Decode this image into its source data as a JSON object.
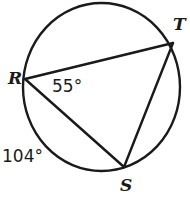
{
  "figure": {
    "kind": "circle-with-inscribed-triangle",
    "stroke_color": "#1a1a1a",
    "fill_color": "#ffffff",
    "background": "#ffffff",
    "circle": {
      "cx": 101.5,
      "cy": 87,
      "rx": 78.5,
      "ry": 84
    },
    "vertices": [
      {
        "id": "R",
        "label": "R",
        "x": 25,
        "y": 79,
        "label_x": 8,
        "label_y": 70
      },
      {
        "id": "T",
        "label": "T",
        "x": 173,
        "y": 43,
        "label_x": 173,
        "label_y": 16
      },
      {
        "id": "S",
        "label": "S",
        "x": 124,
        "y": 167,
        "label_x": 120,
        "label_y": 177
      }
    ],
    "chords": [
      {
        "name": "chord-RT",
        "from": "R",
        "to": "T"
      },
      {
        "name": "chord-RS",
        "from": "R",
        "to": "S"
      },
      {
        "name": "chord-TS",
        "from": "T",
        "to": "S"
      }
    ],
    "measures": [
      {
        "name": "inscribed-angle-R",
        "text": "55°",
        "value": 55,
        "unit": "degrees",
        "at_vertex": "R",
        "x": 52,
        "y": 78
      },
      {
        "name": "arc-measure-RS",
        "text": "104°",
        "value": 104,
        "unit": "degrees",
        "arc": "RS",
        "x": 2,
        "y": 148
      }
    ]
  }
}
